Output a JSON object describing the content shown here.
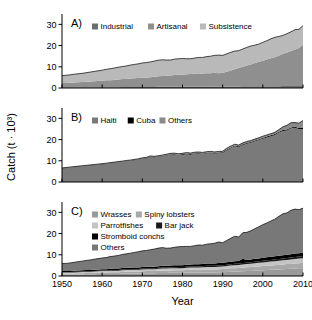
{
  "figure": {
    "y_axis_title": "Catch (t · 10³)",
    "x_axis_title": "Year",
    "x_ticks": [
      "1950",
      "1960",
      "1970",
      "1980",
      "1990",
      "2000",
      "2010"
    ],
    "y_ticks": [
      "0",
      "10",
      "20",
      "30"
    ]
  },
  "colors": {
    "dark_gray": "#6e6e6e",
    "mid_gray": "#8f8f8f",
    "light_gray": "#b9b9b9",
    "pale_gray": "#cfcfcf",
    "black": "#000000",
    "axis": "#000000",
    "background": "#ffffff"
  },
  "chart_data": [
    {
      "type": "area",
      "panel": "A",
      "title": "A)",
      "stacked": true,
      "xlabel": "",
      "ylabel": "Catch (t · 10³)",
      "xlim": [
        1950,
        2010
      ],
      "ylim": [
        0,
        33
      ],
      "grid": false,
      "legend_position": "top-left",
      "legend": [
        "Industrial",
        "Artisanal",
        "Subsistence"
      ],
      "x": [
        1950,
        1951,
        1952,
        1953,
        1954,
        1955,
        1956,
        1957,
        1958,
        1959,
        1960,
        1961,
        1962,
        1963,
        1964,
        1965,
        1966,
        1967,
        1968,
        1969,
        1970,
        1971,
        1972,
        1973,
        1974,
        1975,
        1976,
        1977,
        1978,
        1979,
        1980,
        1981,
        1982,
        1983,
        1984,
        1985,
        1986,
        1987,
        1988,
        1989,
        1990,
        1991,
        1992,
        1993,
        1994,
        1995,
        1996,
        1997,
        1998,
        1999,
        2000,
        2001,
        2002,
        2003,
        2004,
        2005,
        2006,
        2007,
        2008,
        2009,
        2010
      ],
      "series": [
        {
          "name": "Industrial",
          "color": "#6e6e6e",
          "values": [
            0.3,
            0.3,
            0.3,
            0.3,
            0.3,
            0.3,
            0.3,
            0.4,
            0.4,
            0.4,
            0.4,
            0.4,
            0.4,
            0.4,
            0.4,
            0.5,
            0.5,
            0.5,
            0.5,
            0.5,
            0.5,
            0.5,
            0.5,
            0.5,
            0.6,
            0.6,
            0.6,
            0.6,
            0.6,
            0.6,
            0.6,
            0.6,
            0.6,
            0.6,
            0.6,
            0.6,
            0.6,
            0.7,
            0.7,
            0.7,
            0.7,
            0.7,
            0.7,
            0.7,
            0.7,
            0.8,
            0.8,
            0.8,
            0.8,
            0.8,
            0.8,
            0.8,
            0.8,
            0.8,
            0.8,
            0.9,
            0.9,
            0.9,
            0.9,
            0.9,
            0.9
          ]
        },
        {
          "name": "Artisanal",
          "color": "#8f8f8f",
          "values": [
            2.0,
            2.1,
            2.2,
            2.3,
            2.4,
            2.5,
            2.6,
            2.7,
            2.8,
            2.9,
            3.0,
            3.2,
            3.3,
            3.4,
            3.6,
            3.7,
            3.8,
            4.0,
            4.1,
            4.2,
            4.4,
            4.5,
            4.6,
            4.8,
            4.9,
            5.0,
            5.2,
            5.3,
            5.5,
            5.6,
            5.7,
            5.9,
            6.0,
            6.1,
            6.0,
            6.2,
            6.4,
            6.3,
            6.5,
            6.2,
            6.5,
            7.0,
            7.6,
            8.1,
            8.7,
            9.2,
            9.8,
            10.3,
            11.0,
            11.6,
            12.1,
            12.6,
            13.2,
            13.7,
            14.5,
            15.2,
            15.8,
            16.5,
            17.2,
            18.0,
            19.5
          ]
        },
        {
          "name": "Subsistence",
          "color": "#b9b9b9",
          "values": [
            3.5,
            3.6,
            3.7,
            3.9,
            4.0,
            4.1,
            4.3,
            4.4,
            4.6,
            4.8,
            5.0,
            5.2,
            5.4,
            5.6,
            5.8,
            5.9,
            6.1,
            6.3,
            6.5,
            6.7,
            6.9,
            7.0,
            7.2,
            7.4,
            7.6,
            7.7,
            7.4,
            7.3,
            7.5,
            7.6,
            7.6,
            7.3,
            7.2,
            7.4,
            7.8,
            7.6,
            7.8,
            8.0,
            8.2,
            8.6,
            8.2,
            8.4,
            8.5,
            8.6,
            8.2,
            8.4,
            8.5,
            8.7,
            8.4,
            8.3,
            8.6,
            8.9,
            9.2,
            9.4,
            9.0,
            8.7,
            8.9,
            9.1,
            9.4,
            8.8,
            9.0
          ]
        }
      ]
    },
    {
      "type": "area",
      "panel": "B",
      "title": "B)",
      "stacked": true,
      "xlabel": "",
      "ylabel": "Catch (t · 10³)",
      "xlim": [
        1950,
        2010
      ],
      "ylim": [
        0,
        33
      ],
      "grid": false,
      "legend_position": "top-left",
      "legend": [
        "Haiti",
        "Cuba",
        "Others"
      ],
      "x": [
        1950,
        1951,
        1952,
        1953,
        1954,
        1955,
        1956,
        1957,
        1958,
        1959,
        1960,
        1961,
        1962,
        1963,
        1964,
        1965,
        1966,
        1967,
        1968,
        1969,
        1970,
        1971,
        1972,
        1973,
        1974,
        1975,
        1976,
        1977,
        1978,
        1979,
        1980,
        1981,
        1982,
        1983,
        1984,
        1985,
        1986,
        1987,
        1988,
        1989,
        1990,
        1991,
        1992,
        1993,
        1994,
        1995,
        1996,
        1997,
        1998,
        1999,
        2000,
        2001,
        2002,
        2003,
        2004,
        2005,
        2006,
        2007,
        2008,
        2009,
        2010
      ],
      "series": [
        {
          "name": "Haiti",
          "color": "#7a7a7a",
          "values": [
            6.3,
            6.5,
            6.7,
            6.9,
            7.1,
            7.3,
            7.5,
            7.7,
            7.9,
            8.1,
            8.3,
            8.5,
            8.8,
            9.0,
            9.3,
            9.5,
            9.8,
            10.0,
            10.3,
            10.6,
            10.9,
            11.1,
            11.8,
            11.6,
            11.9,
            12.2,
            12.5,
            12.9,
            13.0,
            12.7,
            12.9,
            13.1,
            12.9,
            13.3,
            13.4,
            13.2,
            13.5,
            13.6,
            13.4,
            13.6,
            13.7,
            15.0,
            16.0,
            16.9,
            16.5,
            17.4,
            18.0,
            18.5,
            19.2,
            19.8,
            20.4,
            21.0,
            21.6,
            22.2,
            23.3,
            24.1,
            24.3,
            25.3,
            25.6,
            25.0,
            25.0
          ]
        },
        {
          "name": "Cuba",
          "color": "#000000",
          "values": [
            0.15,
            0.15,
            0.15,
            0.15,
            0.15,
            0.15,
            0.15,
            0.15,
            0.15,
            0.15,
            0.15,
            0.15,
            0.15,
            0.15,
            0.15,
            0.15,
            0.15,
            0.15,
            0.15,
            0.15,
            0.2,
            0.2,
            0.2,
            0.2,
            0.2,
            0.2,
            0.2,
            0.2,
            0.2,
            0.2,
            0.25,
            0.25,
            0.25,
            0.25,
            0.25,
            0.25,
            0.3,
            0.3,
            0.3,
            0.3,
            0.3,
            0.3,
            0.3,
            0.3,
            0.3,
            0.35,
            0.35,
            0.35,
            0.35,
            0.35,
            0.4,
            0.4,
            0.4,
            0.4,
            0.4,
            0.4,
            0.45,
            0.45,
            0.45,
            0.45,
            0.5
          ]
        },
        {
          "name": "Others",
          "color": "#8a8a8a",
          "values": [
            0.2,
            0.2,
            0.2,
            0.2,
            0.2,
            0.2,
            0.2,
            0.2,
            0.2,
            0.2,
            0.2,
            0.2,
            0.2,
            0.2,
            0.2,
            0.2,
            0.2,
            0.2,
            0.2,
            0.2,
            0.3,
            0.3,
            0.3,
            0.3,
            0.3,
            0.3,
            0.4,
            0.4,
            0.4,
            0.4,
            0.4,
            0.5,
            0.5,
            0.5,
            0.5,
            0.5,
            0.5,
            0.5,
            0.5,
            0.5,
            0.5,
            0.6,
            0.6,
            0.6,
            0.6,
            0.7,
            0.7,
            0.7,
            0.7,
            0.7,
            0.8,
            0.8,
            0.8,
            0.8,
            1.0,
            1.5,
            2.0,
            2.2,
            2.0,
            2.3,
            3.5
          ]
        }
      ]
    },
    {
      "type": "area",
      "panel": "C",
      "title": "C)",
      "stacked": true,
      "xlabel": "Year",
      "ylabel": "Catch (t · 10³)",
      "xlim": [
        1950,
        2010
      ],
      "ylim": [
        0,
        33
      ],
      "grid": false,
      "legend_position": "top-left",
      "legend": [
        "Wrasses",
        "Spiny lobsters",
        "Parrotfishes",
        "Bar jack",
        "Stromboid conchs",
        "Others"
      ],
      "x": [
        1950,
        1951,
        1952,
        1953,
        1954,
        1955,
        1956,
        1957,
        1958,
        1959,
        1960,
        1961,
        1962,
        1963,
        1964,
        1965,
        1966,
        1967,
        1968,
        1969,
        1970,
        1971,
        1972,
        1973,
        1974,
        1975,
        1976,
        1977,
        1978,
        1979,
        1980,
        1981,
        1982,
        1983,
        1984,
        1985,
        1986,
        1987,
        1988,
        1989,
        1990,
        1991,
        1992,
        1993,
        1994,
        1995,
        1996,
        1997,
        1998,
        1999,
        2000,
        2001,
        2002,
        2003,
        2004,
        2005,
        2006,
        2007,
        2008,
        2009,
        2010
      ],
      "series": [
        {
          "name": "Wrasses",
          "color": "#9a9a9a",
          "values": [
            0.6,
            0.6,
            0.6,
            0.7,
            0.7,
            0.7,
            0.8,
            0.8,
            0.8,
            0.9,
            0.9,
            0.9,
            1.0,
            1.0,
            1.0,
            1.1,
            1.1,
            1.1,
            1.2,
            1.2,
            1.2,
            1.3,
            1.3,
            1.3,
            1.4,
            1.4,
            1.4,
            1.5,
            1.5,
            1.5,
            1.5,
            1.6,
            1.6,
            1.6,
            1.6,
            1.7,
            1.7,
            1.7,
            1.7,
            1.8,
            1.8,
            1.9,
            2.0,
            2.1,
            2.1,
            2.2,
            2.3,
            2.4,
            2.5,
            2.6,
            2.7,
            2.8,
            2.9,
            3.0,
            3.1,
            3.2,
            3.3,
            3.4,
            3.5,
            3.6,
            3.7
          ]
        },
        {
          "name": "Spiny lobsters",
          "color": "#a8a8a8",
          "values": [
            0.5,
            0.5,
            0.5,
            0.5,
            0.6,
            0.6,
            0.6,
            0.6,
            0.7,
            0.7,
            0.7,
            0.7,
            0.8,
            0.8,
            0.8,
            0.8,
            0.9,
            0.9,
            0.9,
            0.9,
            1.0,
            1.0,
            1.0,
            1.0,
            1.1,
            1.1,
            1.1,
            1.1,
            1.2,
            1.2,
            1.2,
            1.2,
            1.3,
            1.3,
            1.3,
            1.3,
            1.4,
            1.4,
            1.4,
            1.4,
            1.5,
            1.5,
            1.6,
            1.6,
            1.7,
            1.7,
            1.8,
            1.8,
            1.9,
            1.9,
            2.0,
            2.0,
            2.1,
            2.1,
            2.2,
            2.2,
            2.3,
            2.3,
            2.4,
            2.4,
            2.5
          ]
        },
        {
          "name": "Parrotfishes",
          "color": "#c4c4c4",
          "values": [
            0.5,
            0.5,
            0.5,
            0.5,
            0.5,
            0.6,
            0.6,
            0.6,
            0.6,
            0.6,
            0.7,
            0.7,
            0.7,
            0.7,
            0.7,
            0.8,
            0.8,
            0.8,
            0.8,
            0.8,
            0.9,
            0.9,
            0.9,
            0.9,
            0.9,
            1.0,
            1.0,
            1.0,
            1.0,
            1.0,
            1.0,
            1.1,
            1.1,
            1.1,
            1.1,
            1.1,
            1.2,
            1.2,
            1.2,
            1.2,
            1.2,
            1.3,
            1.3,
            1.4,
            1.4,
            1.5,
            1.5,
            1.6,
            1.6,
            1.7,
            1.7,
            1.8,
            1.8,
            1.9,
            1.9,
            2.0,
            2.0,
            2.1,
            2.1,
            2.2,
            2.2
          ]
        },
        {
          "name": "Bar jack",
          "color": "#1a1a1a",
          "values": [
            0.25,
            0.25,
            0.25,
            0.25,
            0.25,
            0.25,
            0.3,
            0.3,
            0.3,
            0.3,
            0.3,
            0.3,
            0.3,
            0.35,
            0.35,
            0.35,
            0.35,
            0.35,
            0.4,
            0.4,
            0.4,
            0.4,
            0.4,
            0.4,
            0.45,
            0.45,
            0.45,
            0.45,
            0.45,
            0.5,
            0.5,
            0.5,
            0.5,
            0.5,
            0.5,
            0.55,
            0.55,
            0.55,
            0.55,
            0.6,
            0.6,
            0.6,
            0.6,
            0.65,
            0.65,
            0.7,
            0.7,
            0.7,
            0.75,
            0.75,
            0.8,
            0.8,
            0.8,
            0.85,
            0.85,
            0.9,
            0.9,
            0.9,
            0.95,
            0.95,
            1.0
          ]
        },
        {
          "name": "Stromboid conchs",
          "color": "#000000",
          "values": [
            0.5,
            0.5,
            0.5,
            0.5,
            0.5,
            0.55,
            0.55,
            0.55,
            0.6,
            0.6,
            0.6,
            0.6,
            0.65,
            0.65,
            0.65,
            0.7,
            0.7,
            0.7,
            0.7,
            0.75,
            0.75,
            0.75,
            0.8,
            0.8,
            0.8,
            0.85,
            0.85,
            0.85,
            0.9,
            0.9,
            0.9,
            0.95,
            0.95,
            1.0,
            1.0,
            1.0,
            1.05,
            1.05,
            1.1,
            1.1,
            1.1,
            1.15,
            1.2,
            1.2,
            1.25,
            2.0,
            1.3,
            1.3,
            1.35,
            1.35,
            1.4,
            1.4,
            1.45,
            1.45,
            1.5,
            1.5,
            1.55,
            1.55,
            1.6,
            1.6,
            1.6
          ]
        },
        {
          "name": "Others",
          "color": "#787878",
          "values": [
            3.5,
            3.6,
            3.8,
            4.0,
            4.2,
            4.3,
            4.5,
            4.7,
            4.9,
            5.1,
            5.3,
            5.5,
            5.7,
            5.9,
            6.2,
            6.4,
            6.6,
            6.9,
            7.1,
            7.4,
            7.6,
            7.7,
            8.0,
            8.3,
            8.5,
            8.6,
            8.3,
            8.3,
            8.5,
            8.7,
            8.8,
            8.6,
            8.5,
            8.8,
            9.1,
            8.9,
            9.1,
            9.3,
            9.5,
            9.9,
            9.5,
            10.3,
            11.1,
            11.8,
            11.3,
            12.3,
            13.0,
            13.5,
            14.2,
            14.9,
            15.6,
            16.2,
            16.9,
            17.5,
            18.6,
            19.5,
            19.7,
            20.7,
            21.0,
            20.5,
            21.0
          ]
        }
      ]
    }
  ]
}
